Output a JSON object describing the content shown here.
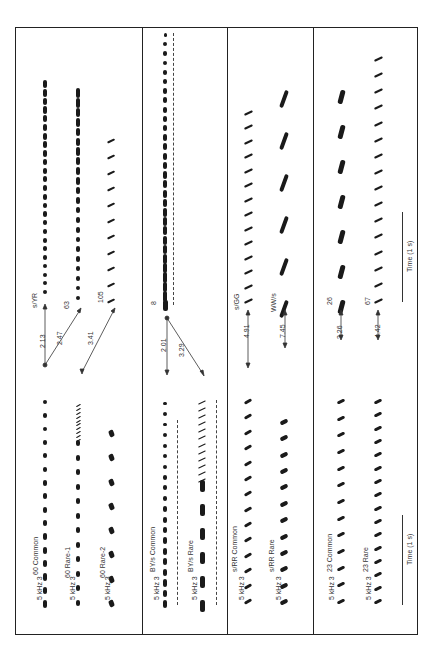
{
  "figure": {
    "orientation": "rotated-90-ccw",
    "panels": [
      {
        "id": "panel-60",
        "rows": [
          {
            "label": "60  Common",
            "x": 45
          },
          {
            "label": "60  Rare-1",
            "x": 77
          },
          {
            "label": "60  Rare-2",
            "x": 109
          }
        ],
        "switch_targets": [
          {
            "label": "s/YR",
            "x": 45
          },
          {
            "label": "63",
            "x": 77
          },
          {
            "label": "105",
            "x": 109
          }
        ],
        "distances": [
          "2.13",
          "2.47",
          "3.41"
        ]
      },
      {
        "id": "panel-BYs",
        "rows": [
          {
            "label": "BY/s  Common",
            "x": 165
          },
          {
            "label": "BY/s  Rare",
            "x": 202
          }
        ],
        "switch_targets": [
          {
            "label": "8",
            "x": 165
          }
        ],
        "distances": [
          "2.01",
          "3.29"
        ]
      },
      {
        "id": "panel-sRR",
        "rows": [
          {
            "label": "s/RR  Common",
            "x": 248
          },
          {
            "label": "s/RR  Rare",
            "x": 284
          }
        ],
        "switch_targets": [
          {
            "label": "s/GG",
            "x": 248
          },
          {
            "label": "WW/s",
            "x": 284
          }
        ],
        "distances": [
          "4.91",
          "7.45"
        ]
      },
      {
        "id": "panel-23",
        "rows": [
          {
            "label": "23 Common",
            "x": 337
          },
          {
            "label": "23 Rare",
            "x": 377
          }
        ],
        "switch_targets": [
          {
            "label": "26",
            "x": 337
          },
          {
            "label": "67",
            "x": 377
          }
        ],
        "distances": [
          "3.26",
          "4.42"
        ]
      }
    ],
    "axis": {
      "freq_unit": "kHz",
      "freq_ticks": [
        "5",
        "3"
      ]
    },
    "time_scale_label": "Time (1 s)",
    "time_scale_label_2": "Time (1 s)"
  }
}
